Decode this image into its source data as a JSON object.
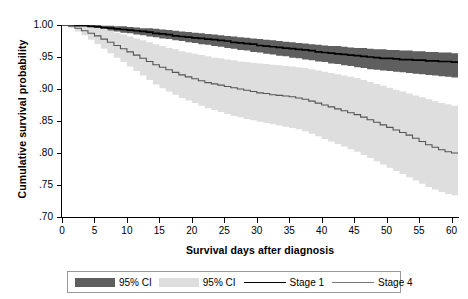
{
  "chart_data": {
    "type": "line",
    "title": "",
    "xlabel": "Survival days after diagnosis",
    "ylabel": "Cumulative survival probability",
    "xlim": [
      0,
      61
    ],
    "ylim": [
      0.7,
      1.0
    ],
    "xticks": [
      0,
      5,
      10,
      15,
      20,
      25,
      30,
      35,
      40,
      45,
      50,
      55,
      60
    ],
    "xtick_labels": [
      "0",
      "5",
      "10",
      "15",
      "20",
      "25",
      "30",
      "35",
      "40",
      "45",
      "50",
      "55",
      "60"
    ],
    "yticks": [
      0.7,
      0.75,
      0.8,
      0.85,
      0.9,
      0.95,
      1.0
    ],
    "ytick_labels": [
      ".70",
      ".75",
      ".80",
      ".85",
      ".90",
      ".95",
      "1.00"
    ],
    "grid": false,
    "step_style": "post",
    "legend_position": "below-axes",
    "colors": {
      "ci_stage1": "#5f5f5f",
      "ci_stage4": "#dedede",
      "line_stage1": "#000000",
      "line_stage4": "#555555",
      "axis": "#000000",
      "legend_border": "#9a9a9a"
    },
    "series": [
      {
        "name": "Stage 1",
        "kind": "survival-curve",
        "color": "#000000",
        "x": [
          0,
          1,
          2,
          3,
          4,
          5,
          6,
          7,
          8,
          9,
          10,
          11,
          12,
          13,
          14,
          15,
          16,
          17,
          18,
          19,
          20,
          21,
          22,
          23,
          24,
          25,
          26,
          27,
          28,
          29,
          30,
          31,
          32,
          33,
          34,
          35,
          36,
          37,
          38,
          39,
          40,
          41,
          42,
          43,
          44,
          45,
          46,
          47,
          48,
          49,
          50,
          51,
          52,
          53,
          54,
          55,
          56,
          57,
          58,
          59,
          60,
          61
        ],
        "values": [
          1.0,
          1.0,
          0.999,
          0.999,
          0.998,
          0.997,
          0.996,
          0.995,
          0.994,
          0.993,
          0.992,
          0.991,
          0.99,
          0.989,
          0.987,
          0.986,
          0.985,
          0.983,
          0.982,
          0.981,
          0.98,
          0.979,
          0.978,
          0.977,
          0.976,
          0.975,
          0.973,
          0.972,
          0.971,
          0.97,
          0.968,
          0.967,
          0.966,
          0.965,
          0.964,
          0.963,
          0.962,
          0.961,
          0.96,
          0.958,
          0.957,
          0.956,
          0.955,
          0.954,
          0.953,
          0.952,
          0.951,
          0.95,
          0.949,
          0.948,
          0.948,
          0.947,
          0.946,
          0.946,
          0.945,
          0.945,
          0.944,
          0.944,
          0.943,
          0.943,
          0.942,
          0.942
        ]
      },
      {
        "name": "Stage 4",
        "kind": "survival-curve",
        "color": "#555555",
        "x": [
          0,
          1,
          2,
          3,
          4,
          5,
          6,
          7,
          8,
          9,
          10,
          11,
          12,
          13,
          14,
          15,
          16,
          17,
          18,
          19,
          20,
          21,
          22,
          23,
          24,
          25,
          26,
          27,
          28,
          29,
          30,
          31,
          32,
          33,
          34,
          35,
          36,
          37,
          38,
          39,
          40,
          41,
          42,
          43,
          44,
          45,
          46,
          47,
          48,
          49,
          50,
          51,
          52,
          53,
          54,
          55,
          56,
          57,
          58,
          59,
          60,
          61
        ],
        "values": [
          1.0,
          0.998,
          0.995,
          0.991,
          0.987,
          0.983,
          0.978,
          0.973,
          0.968,
          0.963,
          0.958,
          0.953,
          0.948,
          0.943,
          0.938,
          0.934,
          0.93,
          0.926,
          0.922,
          0.919,
          0.916,
          0.913,
          0.91,
          0.908,
          0.906,
          0.904,
          0.902,
          0.9,
          0.898,
          0.896,
          0.894,
          0.893,
          0.891,
          0.89,
          0.889,
          0.888,
          0.886,
          0.884,
          0.881,
          0.878,
          0.875,
          0.872,
          0.869,
          0.866,
          0.863,
          0.86,
          0.856,
          0.852,
          0.848,
          0.844,
          0.84,
          0.836,
          0.832,
          0.828,
          0.823,
          0.818,
          0.813,
          0.809,
          0.805,
          0.802,
          0.8,
          0.8
        ]
      }
    ],
    "confidence_bands": [
      {
        "name": "95% CI",
        "of_series": "Stage 1",
        "color": "#5f5f5f",
        "x": [
          0,
          1,
          2,
          3,
          4,
          5,
          6,
          7,
          8,
          9,
          10,
          11,
          12,
          13,
          14,
          15,
          16,
          17,
          18,
          19,
          20,
          21,
          22,
          23,
          24,
          25,
          26,
          27,
          28,
          29,
          30,
          31,
          32,
          33,
          34,
          35,
          36,
          37,
          38,
          39,
          40,
          41,
          42,
          43,
          44,
          45,
          46,
          47,
          48,
          49,
          50,
          51,
          52,
          53,
          54,
          55,
          56,
          57,
          58,
          59,
          60,
          61
        ],
        "upper": [
          1.0,
          1.0,
          1.0,
          1.0,
          1.0,
          1.0,
          0.999,
          0.999,
          0.998,
          0.998,
          0.997,
          0.996,
          0.995,
          0.995,
          0.994,
          0.993,
          0.992,
          0.991,
          0.99,
          0.989,
          0.988,
          0.987,
          0.986,
          0.985,
          0.984,
          0.983,
          0.982,
          0.981,
          0.98,
          0.979,
          0.978,
          0.977,
          0.976,
          0.975,
          0.974,
          0.973,
          0.972,
          0.971,
          0.97,
          0.969,
          0.968,
          0.967,
          0.967,
          0.966,
          0.965,
          0.964,
          0.964,
          0.963,
          0.962,
          0.962,
          0.961,
          0.961,
          0.96,
          0.96,
          0.959,
          0.959,
          0.958,
          0.958,
          0.957,
          0.957,
          0.956,
          0.956
        ],
        "lower": [
          1.0,
          1.0,
          0.998,
          0.997,
          0.996,
          0.994,
          0.993,
          0.991,
          0.99,
          0.988,
          0.987,
          0.985,
          0.984,
          0.982,
          0.981,
          0.979,
          0.978,
          0.976,
          0.975,
          0.973,
          0.972,
          0.97,
          0.969,
          0.967,
          0.966,
          0.964,
          0.963,
          0.961,
          0.96,
          0.958,
          0.957,
          0.955,
          0.954,
          0.952,
          0.951,
          0.949,
          0.948,
          0.946,
          0.945,
          0.943,
          0.942,
          0.94,
          0.939,
          0.937,
          0.936,
          0.934,
          0.933,
          0.931,
          0.93,
          0.929,
          0.928,
          0.927,
          0.926,
          0.925,
          0.924,
          0.923,
          0.922,
          0.921,
          0.92,
          0.919,
          0.918,
          0.918
        ]
      },
      {
        "name": "95% CI",
        "of_series": "Stage 4",
        "color": "#dedede",
        "x": [
          0,
          1,
          2,
          3,
          4,
          5,
          6,
          7,
          8,
          9,
          10,
          11,
          12,
          13,
          14,
          15,
          16,
          17,
          18,
          19,
          20,
          21,
          22,
          23,
          24,
          25,
          26,
          27,
          28,
          29,
          30,
          31,
          32,
          33,
          34,
          35,
          36,
          37,
          38,
          39,
          40,
          41,
          42,
          43,
          44,
          45,
          46,
          47,
          48,
          49,
          50,
          51,
          52,
          53,
          54,
          55,
          56,
          57,
          58,
          59,
          60,
          61
        ],
        "upper": [
          1.0,
          1.0,
          1.0,
          0.999,
          0.998,
          0.996,
          0.994,
          0.991,
          0.988,
          0.985,
          0.982,
          0.979,
          0.976,
          0.973,
          0.97,
          0.967,
          0.964,
          0.962,
          0.959,
          0.957,
          0.955,
          0.953,
          0.951,
          0.949,
          0.948,
          0.946,
          0.945,
          0.943,
          0.942,
          0.941,
          0.94,
          0.939,
          0.938,
          0.937,
          0.936,
          0.935,
          0.934,
          0.933,
          0.931,
          0.929,
          0.927,
          0.925,
          0.923,
          0.921,
          0.919,
          0.917,
          0.914,
          0.911,
          0.908,
          0.905,
          0.902,
          0.899,
          0.896,
          0.893,
          0.89,
          0.887,
          0.884,
          0.881,
          0.878,
          0.876,
          0.874,
          0.874
        ],
        "lower": [
          1.0,
          0.995,
          0.99,
          0.984,
          0.977,
          0.97,
          0.963,
          0.956,
          0.949,
          0.942,
          0.935,
          0.928,
          0.921,
          0.914,
          0.907,
          0.901,
          0.896,
          0.891,
          0.886,
          0.882,
          0.878,
          0.874,
          0.87,
          0.867,
          0.864,
          0.861,
          0.858,
          0.856,
          0.853,
          0.851,
          0.849,
          0.847,
          0.845,
          0.843,
          0.841,
          0.839,
          0.837,
          0.834,
          0.83,
          0.826,
          0.822,
          0.818,
          0.814,
          0.81,
          0.806,
          0.802,
          0.797,
          0.792,
          0.787,
          0.782,
          0.777,
          0.772,
          0.767,
          0.762,
          0.757,
          0.752,
          0.747,
          0.743,
          0.739,
          0.736,
          0.734,
          0.734
        ]
      }
    ],
    "legend": [
      {
        "label": "95% CI",
        "marker": "swatch",
        "color": "#5f5f5f"
      },
      {
        "label": "95% CI",
        "marker": "swatch",
        "color": "#dedede"
      },
      {
        "label": "Stage 1",
        "marker": "line",
        "color": "#000000"
      },
      {
        "label": "Stage 4",
        "marker": "line",
        "color": "#777777"
      }
    ]
  }
}
